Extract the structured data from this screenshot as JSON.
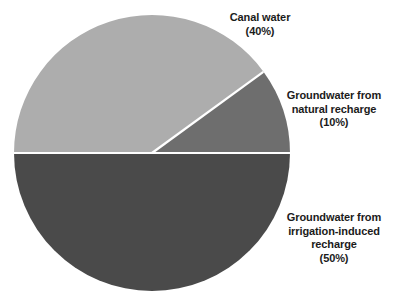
{
  "chart_data": {
    "type": "pie",
    "title": "",
    "subtitle": "",
    "xlabel": "",
    "ylabel": "",
    "grid": false,
    "legend_position": "none",
    "labels_position": "outside-right",
    "background_color": "#ffffff",
    "slice_border_color": "#ffffff",
    "start_angle_deg": 0,
    "direction": "counterclockwise",
    "categories": [
      "Groundwater from natural recharge",
      "Canal water",
      "Groundwater from irrigation-induced recharge"
    ],
    "values": [
      10,
      40,
      50
    ],
    "units": "percent",
    "colors": [
      "#6e6e6e",
      "#adadad",
      "#4a4a4a"
    ],
    "slices": [
      {
        "name": "Groundwater from natural recharge",
        "value": 10,
        "value_label": "(10%)",
        "color": "#6e6e6e",
        "start_angle_deg": 0,
        "end_angle_deg": 36
      },
      {
        "name": "Canal water",
        "value": 40,
        "value_label": "(40%)",
        "color": "#adadad",
        "start_angle_deg": 36,
        "end_angle_deg": 180
      },
      {
        "name": "Groundwater from irrigation-induced recharge",
        "value": 50,
        "value_label": "(50%)",
        "color": "#4a4a4a",
        "start_angle_deg": 180,
        "end_angle_deg": 360
      }
    ]
  },
  "labels": {
    "canal_water": "Canal water\n(40%)",
    "natural_recharge": "Groundwater from\nnatural recharge\n(10%)",
    "irrigation_recharge": "Groundwater from\nirrigation-induced\nrecharge\n(50%)"
  }
}
